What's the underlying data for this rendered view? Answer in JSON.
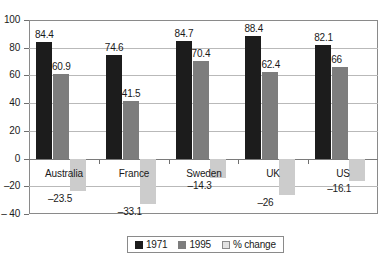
{
  "chart_data": {
    "type": "bar",
    "title": "",
    "subtitle": "",
    "xlabel": "",
    "ylabel": "",
    "ylim": [
      -40,
      100
    ],
    "ytick_labels": [
      "100",
      "80",
      "60",
      "40",
      "20",
      "0",
      "–20",
      "– 40"
    ],
    "ytick_values": [
      100,
      80,
      60,
      40,
      20,
      0,
      -20,
      -40
    ],
    "grid": true,
    "legend_position": "bottom-center",
    "categories": [
      "Australia",
      "France",
      "Sweden",
      "UK",
      "US"
    ],
    "series": [
      {
        "name": "1971",
        "color": "#1c1c1c",
        "values": [
          84.4,
          74.6,
          84.7,
          88.4,
          82.1
        ],
        "labels": [
          "84.4",
          "74.6",
          "84.7",
          "88.4",
          "82.1"
        ]
      },
      {
        "name": "1995",
        "color": "#7d7d7d",
        "values": [
          60.9,
          41.5,
          70.4,
          62.4,
          66
        ],
        "labels": [
          "60.9",
          "41.5",
          "70.4",
          "62.4",
          "66"
        ]
      },
      {
        "name": "% change",
        "color": "#cccccc",
        "values": [
          -23.5,
          -33.1,
          -14.3,
          -26,
          -16.1
        ],
        "labels": [
          "–23.5",
          "–33.1",
          "–14.3",
          "–26",
          "–16.1"
        ]
      }
    ]
  },
  "legend": {
    "entries": [
      {
        "label": "1971",
        "swatch": "legend-swatch-1971"
      },
      {
        "label": "1995",
        "swatch": "legend-swatch-1995"
      },
      {
        "label": "% change",
        "swatch": "legend-swatch-pct-change"
      }
    ]
  }
}
